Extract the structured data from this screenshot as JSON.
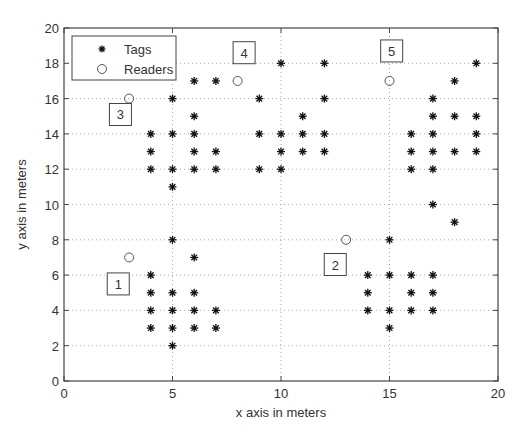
{
  "chart_data": {
    "type": "scatter",
    "title": "",
    "xlabel": "x axis in meters",
    "ylabel": "y axis in meters",
    "xlim": [
      0,
      20
    ],
    "ylim": [
      0,
      20
    ],
    "xticks": [
      0,
      5,
      10,
      15,
      20
    ],
    "yticks": [
      0,
      2,
      4,
      6,
      8,
      10,
      12,
      14,
      16,
      18,
      20
    ],
    "grid": true,
    "legend_position": "upper left",
    "series": [
      {
        "name": "Tags",
        "marker": "asterisk",
        "points": [
          [
            4,
            14
          ],
          [
            4,
            13
          ],
          [
            4,
            12
          ],
          [
            5,
            16
          ],
          [
            5,
            14
          ],
          [
            5,
            12
          ],
          [
            5,
            11
          ],
          [
            6,
            17
          ],
          [
            6,
            15
          ],
          [
            6,
            14
          ],
          [
            6,
            13
          ],
          [
            6,
            12
          ],
          [
            7,
            17
          ],
          [
            7,
            13
          ],
          [
            7,
            12
          ],
          [
            9,
            16
          ],
          [
            9,
            14
          ],
          [
            9,
            12
          ],
          [
            10,
            18
          ],
          [
            10,
            14
          ],
          [
            10,
            13
          ],
          [
            10,
            12
          ],
          [
            11,
            15
          ],
          [
            11,
            14
          ],
          [
            11,
            13
          ],
          [
            12,
            18
          ],
          [
            12,
            16
          ],
          [
            12,
            14
          ],
          [
            12,
            13
          ],
          [
            16,
            14
          ],
          [
            16,
            13
          ],
          [
            16,
            12
          ],
          [
            17,
            16
          ],
          [
            17,
            15
          ],
          [
            17,
            14
          ],
          [
            17,
            13
          ],
          [
            17,
            12
          ],
          [
            17,
            10
          ],
          [
            18,
            17
          ],
          [
            18,
            15
          ],
          [
            18,
            13
          ],
          [
            18,
            9
          ],
          [
            19,
            18
          ],
          [
            19,
            15
          ],
          [
            19,
            14
          ],
          [
            19,
            13
          ],
          [
            4,
            6
          ],
          [
            4,
            5
          ],
          [
            4,
            4
          ],
          [
            4,
            3
          ],
          [
            5,
            8
          ],
          [
            5,
            5
          ],
          [
            5,
            4
          ],
          [
            5,
            3
          ],
          [
            5,
            2
          ],
          [
            6,
            7
          ],
          [
            6,
            5
          ],
          [
            6,
            4
          ],
          [
            6,
            3
          ],
          [
            7,
            4
          ],
          [
            7,
            3
          ],
          [
            14,
            6
          ],
          [
            14,
            5
          ],
          [
            14,
            4
          ],
          [
            15,
            8
          ],
          [
            15,
            6
          ],
          [
            15,
            4
          ],
          [
            15,
            3
          ],
          [
            16,
            6
          ],
          [
            16,
            5
          ],
          [
            16,
            4
          ],
          [
            17,
            6
          ],
          [
            17,
            5
          ],
          [
            17,
            4
          ]
        ]
      },
      {
        "name": "Readers",
        "marker": "circle",
        "points": [
          [
            3,
            7
          ],
          [
            13,
            8
          ],
          [
            3,
            16
          ],
          [
            8,
            17
          ],
          [
            15,
            17
          ]
        ]
      }
    ],
    "annotations": [
      {
        "text": "1",
        "x": 2.5,
        "y": 5.5
      },
      {
        "text": "2",
        "x": 12.5,
        "y": 6.6
      },
      {
        "text": "3",
        "x": 2.6,
        "y": 15.1
      },
      {
        "text": "4",
        "x": 8.3,
        "y": 18.6
      },
      {
        "text": "5",
        "x": 15.1,
        "y": 18.7
      }
    ]
  },
  "colors": {
    "axis": "#444444",
    "grid": "#aaaaaa",
    "marker": "#111111",
    "text": "#333333",
    "background": "#ffffff"
  }
}
